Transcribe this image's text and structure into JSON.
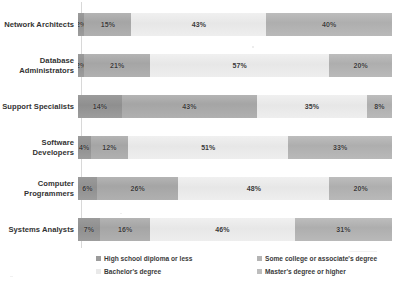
{
  "chart_data": {
    "type": "bar",
    "orientation": "horizontal",
    "stacked": true,
    "normalized": true,
    "title": "",
    "subtitle": "",
    "xlabel": "",
    "ylabel": "",
    "xlim": [
      0,
      100
    ],
    "grid": false,
    "legend_position": "bottom",
    "categories": [
      "Network Architects",
      "Database Administrators",
      "Support Specialists",
      "Software Developers",
      "Computer Programmers",
      "Systems Analysts"
    ],
    "series": [
      {
        "name": "High school diploma or less",
        "color": "#9b9b9b",
        "values": [
          2,
          2,
          14,
          4,
          6,
          7
        ],
        "labels": [
          "2%",
          "2%",
          "14%",
          "4%",
          "6%",
          "7%"
        ]
      },
      {
        "name": "Some college or associate's degree",
        "color": "#b4b4b4",
        "values": [
          15,
          21,
          43,
          12,
          26,
          16
        ],
        "labels": [
          "15%",
          "21%",
          "43%",
          "12%",
          "26%",
          "16%"
        ]
      },
      {
        "name": "Bachelor's degree",
        "color": "#e9e9e9",
        "values": [
          43,
          57,
          35,
          51,
          48,
          46
        ],
        "labels": [
          "43%",
          "57%",
          "35%",
          "51%",
          "48%",
          "46%"
        ]
      },
      {
        "name": "Master's degree or higher",
        "color": "#bdbdbd",
        "values": [
          40,
          20,
          8,
          33,
          20,
          31
        ],
        "labels": [
          "40%",
          "20%",
          "8%",
          "33%",
          "20%",
          "31%"
        ]
      }
    ]
  },
  "rows": [
    {
      "label": "Network Architects",
      "segments": [
        {
          "label": "2%",
          "value": 2
        },
        {
          "label": "15%",
          "value": 15
        },
        {
          "label": "43%",
          "value": 43
        },
        {
          "label": "40%",
          "value": 40
        }
      ]
    },
    {
      "label": "Database\nAdministrators",
      "segments": [
        {
          "label": "2%",
          "value": 2
        },
        {
          "label": "21%",
          "value": 21
        },
        {
          "label": "57%",
          "value": 57
        },
        {
          "label": "20%",
          "value": 20
        }
      ]
    },
    {
      "label": "Support Specialists",
      "segments": [
        {
          "label": "14%",
          "value": 14
        },
        {
          "label": "43%",
          "value": 43
        },
        {
          "label": "35%",
          "value": 35
        },
        {
          "label": "8%",
          "value": 8
        }
      ]
    },
    {
      "label": "Software Developers",
      "segments": [
        {
          "label": "4%",
          "value": 4
        },
        {
          "label": "12%",
          "value": 12
        },
        {
          "label": "51%",
          "value": 51
        },
        {
          "label": "33%",
          "value": 33
        }
      ]
    },
    {
      "label": "Computer\nProgrammers",
      "segments": [
        {
          "label": "6%",
          "value": 6
        },
        {
          "label": "26%",
          "value": 26
        },
        {
          "label": "48%",
          "value": 48
        },
        {
          "label": "20%",
          "value": 20
        }
      ]
    },
    {
      "label": "Systems Analysts",
      "segments": [
        {
          "label": "7%",
          "value": 7
        },
        {
          "label": "16%",
          "value": 16
        },
        {
          "label": "46%",
          "value": 46
        },
        {
          "label": "31%",
          "value": 31
        }
      ]
    }
  ],
  "legend": {
    "items": [
      {
        "label": "High school diploma or less",
        "color": "#9b9b9b"
      },
      {
        "label": "Some college or associate's degree",
        "color": "#b4b4b4"
      },
      {
        "label": "Bachelor's degree",
        "color": "#e9e9e9"
      },
      {
        "label": "Master's degree or higher",
        "color": "#bdbdbd"
      }
    ]
  }
}
